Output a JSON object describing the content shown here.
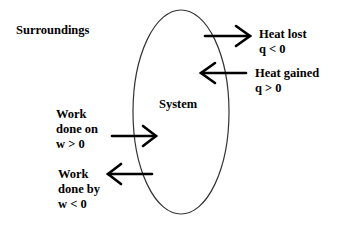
{
  "diagram": {
    "surroundings_label": "Surroundings",
    "system_label": "System",
    "heat_lost": {
      "title": "Heat lost",
      "sign": "q < 0",
      "direction": "out"
    },
    "heat_gained": {
      "title": "Heat gained",
      "sign": "q > 0",
      "direction": "in"
    },
    "work_on": {
      "line1": "Work",
      "line2": "done on",
      "sign": "w > 0",
      "direction": "in"
    },
    "work_by": {
      "line1": "Work",
      "line2": "done by",
      "sign": "w < 0",
      "direction": "out"
    },
    "colors": {
      "ink": "#000000",
      "boundary": "#333333",
      "background": "#ffffff"
    }
  }
}
